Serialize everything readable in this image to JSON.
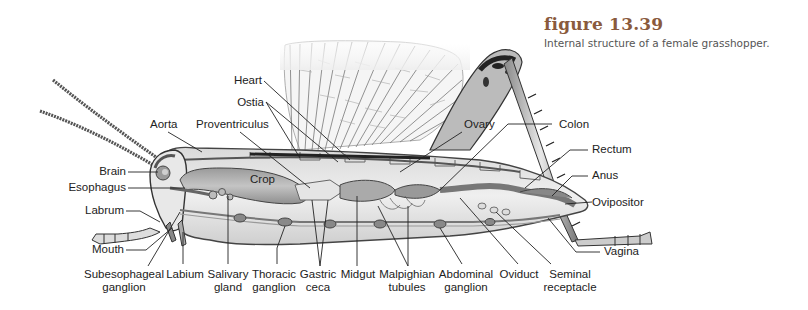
{
  "figure": {
    "title": "figure 13.39",
    "caption": "Internal structure of a female grasshopper.",
    "title_color": "#8a5a3c",
    "caption_color": "#555555"
  },
  "diagram": {
    "inner_label": "Crop",
    "labels": {
      "heart": "Heart",
      "ostia": "Ostia",
      "aorta": "Aorta",
      "proventriculus": "Proventriculus",
      "ovary": "Ovary",
      "colon": "Colon",
      "brain": "Brain",
      "esophagus": "Esophagus",
      "labrum": "Labrum",
      "mouth": "Mouth",
      "rectum": "Rectum",
      "anus": "Anus",
      "ovipositor": "Ovipositor",
      "vagina": "Vagina",
      "subesophageal_ganglion": [
        "Subesophageal",
        "ganglion"
      ],
      "labium": "Labium",
      "salivary_gland": [
        "Salivary",
        "gland"
      ],
      "thoracic_ganglion": [
        "Thoracic",
        "ganglion"
      ],
      "gastric_ceca": [
        "Gastric",
        "ceca"
      ],
      "midgut": "Midgut",
      "malpighian_tubules": [
        "Malpighian",
        "tubules"
      ],
      "abdominal_ganglion": [
        "Abdominal",
        "ganglion"
      ],
      "oviduct": "Oviduct",
      "seminal_receptacle": [
        "Seminal",
        "receptacle"
      ]
    }
  }
}
